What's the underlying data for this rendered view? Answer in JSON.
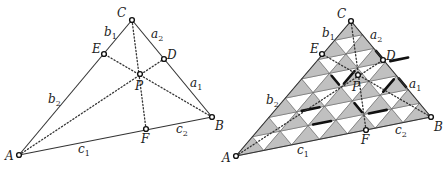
{
  "left_figure": {
    "points": {
      "A": {
        "x": 19,
        "y": 155,
        "label": "A",
        "lx": 5,
        "ly": 160
      },
      "B": {
        "x": 212,
        "y": 117,
        "label": "B",
        "lx": 215,
        "ly": 130
      },
      "C": {
        "x": 132,
        "y": 20,
        "label": "C",
        "lx": 117,
        "ly": 17
      },
      "D": {
        "x": 164,
        "y": 59,
        "label": "D",
        "lx": 167,
        "ly": 59
      },
      "E": {
        "x": 104,
        "y": 54,
        "label": "E",
        "lx": 92,
        "ly": 53
      },
      "F": {
        "x": 146,
        "y": 129,
        "label": "F",
        "lx": 141,
        "ly": 143
      },
      "P": {
        "x": 140,
        "y": 74,
        "label": "P",
        "lx": 135,
        "ly": 90
      }
    },
    "side_labels": [
      {
        "main": "b",
        "sub": "1",
        "x": 104,
        "y": 36
      },
      {
        "main": "a",
        "sub": "2",
        "x": 151,
        "y": 38
      },
      {
        "main": "a",
        "sub": "1",
        "x": 190,
        "y": 87
      },
      {
        "main": "b",
        "sub": "2",
        "x": 48,
        "y": 103
      },
      {
        "main": "c",
        "sub": "1",
        "x": 78,
        "y": 153
      },
      {
        "main": "c",
        "sub": "2",
        "x": 176,
        "y": 133
      }
    ]
  },
  "right_figure": {
    "grid_divisions": 7,
    "fill_up": "#c0c0c0",
    "fill_down": "#ffffff",
    "points": {
      "A": {
        "x": 236,
        "y": 156,
        "label": "A",
        "lx": 222,
        "ly": 162
      },
      "B": {
        "x": 431,
        "y": 117,
        "label": "B",
        "lx": 434,
        "ly": 131
      },
      "C": {
        "x": 351,
        "y": 21,
        "label": "C",
        "lx": 337,
        "ly": 18
      },
      "D": {
        "x": 383,
        "y": 60,
        "label": "D",
        "lx": 386,
        "ly": 60
      },
      "E": {
        "x": 322,
        "y": 54,
        "label": "E",
        "lx": 310,
        "ly": 53
      },
      "F": {
        "x": 366,
        "y": 130,
        "label": "F",
        "lx": 361,
        "ly": 144
      },
      "P": {
        "x": 358,
        "y": 75,
        "label": "P",
        "lx": 352,
        "ly": 91
      }
    },
    "side_labels": [
      {
        "main": "b",
        "sub": "1",
        "x": 322,
        "y": 37
      },
      {
        "main": "a",
        "sub": "2",
        "x": 370,
        "y": 39
      },
      {
        "main": "a",
        "sub": "1",
        "x": 409,
        "y": 88
      },
      {
        "main": "b",
        "sub": "2",
        "x": 266,
        "y": 104
      },
      {
        "main": "c",
        "sub": "1",
        "x": 297,
        "y": 154
      },
      {
        "main": "c",
        "sub": "2",
        "x": 395,
        "y": 134
      }
    ]
  }
}
